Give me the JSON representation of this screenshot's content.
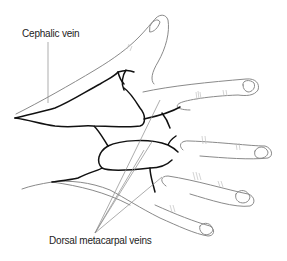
{
  "figure": {
    "labels": {
      "cephalic_vein": "Cephalic vein",
      "dorsal_metacarpal_veins": "Dorsal metacarpal veins"
    },
    "colors": {
      "outline": "#8a8a8a",
      "vein": "#111111",
      "leader": "#8a8a8a",
      "background": "#ffffff"
    }
  }
}
